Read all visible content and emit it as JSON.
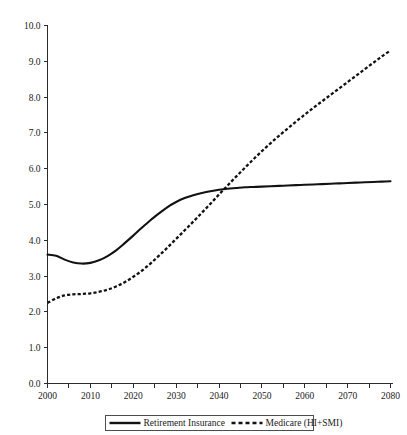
{
  "chart_data": {
    "type": "line",
    "title": "",
    "subtitle": "",
    "xlabel": "",
    "ylabel": "",
    "xlim": [
      2000,
      2080
    ],
    "ylim": [
      0.0,
      10.0
    ],
    "grid": false,
    "legend_position": "bottom-center",
    "x_ticks_major": [
      2000,
      2010,
      2020,
      2030,
      2040,
      2050,
      2060,
      2070,
      2080
    ],
    "x_ticks_minor": [
      2005,
      2015,
      2025,
      2035,
      2045,
      2055,
      2065,
      2075
    ],
    "y_ticks": [
      "0.0",
      "1.0",
      "2.0",
      "3.0",
      "4.0",
      "5.0",
      "6.0",
      "7.0",
      "8.0",
      "9.0",
      "10.0"
    ],
    "x_tick_labels": [
      "2000",
      "2010",
      "2020",
      "2030",
      "2040",
      "2050",
      "2060",
      "2070",
      "2080"
    ],
    "x": [
      2000,
      2002,
      2004,
      2006,
      2008,
      2010,
      2012,
      2014,
      2016,
      2018,
      2020,
      2022,
      2024,
      2026,
      2028,
      2030,
      2032,
      2034,
      2036,
      2038,
      2040,
      2042,
      2044,
      2046,
      2048,
      2050,
      2052,
      2054,
      2056,
      2058,
      2060,
      2062,
      2064,
      2066,
      2068,
      2070,
      2072,
      2074,
      2076,
      2078,
      2080
    ],
    "series": [
      {
        "name": "Retirement Insurance",
        "style": "solid",
        "color": "#121212",
        "values": [
          3.6,
          3.57,
          3.46,
          3.38,
          3.35,
          3.37,
          3.44,
          3.56,
          3.72,
          3.92,
          4.13,
          4.35,
          4.56,
          4.75,
          4.93,
          5.07,
          5.18,
          5.26,
          5.32,
          5.37,
          5.41,
          5.44,
          5.46,
          5.48,
          5.49,
          5.5,
          5.51,
          5.52,
          5.53,
          5.54,
          5.55,
          5.56,
          5.57,
          5.58,
          5.59,
          5.6,
          5.61,
          5.62,
          5.63,
          5.64,
          5.65
        ]
      },
      {
        "name": "Medicare (HI+SMI)",
        "style": "dashed",
        "color": "#121212",
        "values": [
          2.25,
          2.38,
          2.46,
          2.49,
          2.5,
          2.52,
          2.56,
          2.62,
          2.71,
          2.83,
          2.98,
          3.15,
          3.35,
          3.57,
          3.8,
          4.04,
          4.28,
          4.52,
          4.77,
          5.02,
          5.28,
          5.53,
          5.78,
          6.02,
          6.26,
          6.49,
          6.71,
          6.92,
          7.12,
          7.32,
          7.51,
          7.7,
          7.88,
          8.06,
          8.24,
          8.42,
          8.6,
          8.78,
          8.96,
          9.14,
          9.3
        ]
      }
    ],
    "annotations": {
      "crossover_year": 2039,
      "crossover_value": 5.45
    }
  },
  "legend": {
    "entries": [
      {
        "label": "Retirement Insurance",
        "style": "solid"
      },
      {
        "label": "Medicare (HI+SMI)",
        "style": "dashed"
      }
    ]
  }
}
